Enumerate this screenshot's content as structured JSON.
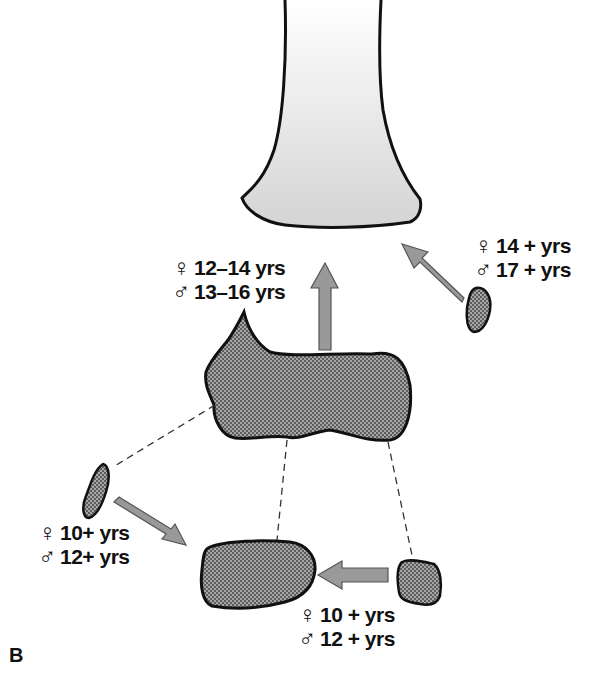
{
  "figure": {
    "panel_label": "B",
    "colors": {
      "outline": "#111111",
      "shaft_fill_top": "#ffffff",
      "shaft_fill_bottom": "#d6d6d6",
      "ossicle_fill": "#9a9a9a",
      "arrow_fill": "#999999",
      "arrow_stroke": "#555555"
    },
    "labels": {
      "epiphysis_center": {
        "female_symbol": "♀",
        "female_age": "12–14 yrs",
        "male_symbol": "♂",
        "male_age": "13–16 yrs"
      },
      "epiphysis_right": {
        "female_symbol": "♀",
        "female_age": "14 + yrs",
        "male_symbol": "♂",
        "male_age": "17 + yrs"
      },
      "ossicle_left": {
        "female_symbol": "♀",
        "female_age": "10+ yrs",
        "male_symbol": "♂",
        "male_age": "12+ yrs"
      },
      "ossicle_bottom_right": {
        "female_symbol": "♀",
        "female_age": "10 + yrs",
        "male_symbol": "♂",
        "male_age": "12 + yrs"
      }
    }
  }
}
